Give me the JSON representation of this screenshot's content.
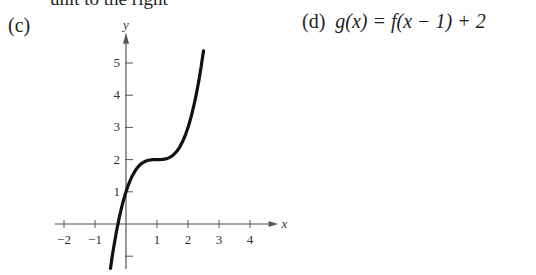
{
  "header": {
    "cut_text": "unit to the right"
  },
  "parts": {
    "c": {
      "label": "(c)"
    },
    "d": {
      "label": "(d)",
      "equation": "g(x) = f(x − 1) + 2"
    }
  },
  "chart_data": {
    "type": "line",
    "title": "",
    "xlabel": "x",
    "ylabel": "y",
    "xlim": [
      -2.3,
      4.8
    ],
    "ylim": [
      -1.3,
      5.8
    ],
    "x_ticks": [
      -2,
      -1,
      1,
      2,
      3,
      4
    ],
    "x_tick_labels": [
      "−2",
      "−1",
      "1",
      "2",
      "3",
      "4"
    ],
    "y_ticks": [
      -1,
      1,
      2,
      3,
      4,
      5
    ],
    "y_tick_labels": [
      "",
      "1",
      "2",
      "3",
      "4",
      "5"
    ],
    "grid": false,
    "series": [
      {
        "name": "g(x) = (x-1)^3 + 2",
        "x": [
          -0.5,
          -0.25,
          0,
          0.25,
          0.5,
          0.75,
          1,
          1.25,
          1.5,
          1.75,
          2,
          2.25,
          2.5
        ],
        "y": [
          -1.38,
          0.05,
          1,
          1.58,
          1.88,
          1.98,
          2,
          2.02,
          2.13,
          2.42,
          3,
          3.95,
          5.38
        ]
      }
    ]
  }
}
